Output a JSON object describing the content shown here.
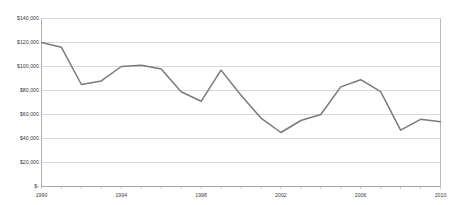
{
  "chart_data": {
    "type": "line",
    "title": "",
    "subtitle": "",
    "xlabel": "",
    "ylabel": "",
    "grid": "horizontal",
    "legend": "none",
    "xlim": [
      1990,
      2010
    ],
    "ylim": [
      0,
      140000
    ],
    "ytick_values": [
      0,
      20000,
      40000,
      60000,
      80000,
      100000,
      120000,
      140000
    ],
    "ytick_labels": [
      "$-",
      "$20,000",
      "$40,000",
      "$60,000",
      "$80,000",
      "$100,000",
      "$120,000",
      "$140,000"
    ],
    "xtick_values": [
      1990,
      1994,
      1998,
      2002,
      2006,
      2010
    ],
    "xtick_labels": [
      "1990",
      "1994",
      "1998",
      "2002",
      "2006",
      "2010"
    ],
    "x_minor_ticks": [
      1990,
      1991,
      1992,
      1993,
      1994,
      1995,
      1996,
      1997,
      1998,
      1999,
      2000,
      2001,
      2002,
      2003,
      2004,
      2005,
      2006,
      2007,
      2008,
      2009,
      2010
    ],
    "x": [
      1990,
      1991,
      1992,
      1993,
      1994,
      1995,
      1996,
      1997,
      1998,
      1999,
      2000,
      2001,
      2002,
      2003,
      2004,
      2005,
      2006,
      2007,
      2008,
      2009,
      2010
    ],
    "values": [
      120000,
      116000,
      85000,
      88000,
      100000,
      101000,
      98000,
      79000,
      71000,
      97000,
      76000,
      57000,
      45000,
      55000,
      60000,
      83000,
      89000,
      79000,
      47000,
      56000,
      54000
    ],
    "series": [
      {
        "name": "series-1",
        "color": "#7a7a7a",
        "values": [
          120000,
          116000,
          85000,
          88000,
          100000,
          101000,
          98000,
          79000,
          71000,
          97000,
          76000,
          57000,
          45000,
          55000,
          60000,
          83000,
          89000,
          79000,
          47000,
          56000,
          54000
        ]
      }
    ]
  },
  "style": {
    "line_color": "#7a7a7a",
    "grid_color": "#c8c8c8",
    "axis_color": "#9a9a9a",
    "tick_color": "#b0b0b0",
    "text_color": "#3a3a3a",
    "background": "#ffffff"
  }
}
